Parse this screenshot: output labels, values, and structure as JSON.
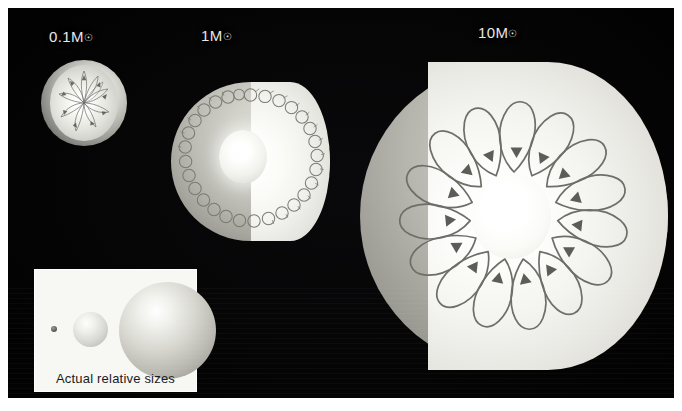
{
  "figure": {
    "background_color": "#ffffff",
    "panel_color": "#060607",
    "title_text_color": "#e9e9e6"
  },
  "stars": [
    {
      "id": "star-a",
      "mass_label": "0.1M",
      "mass_symbol": "☉",
      "structure": "fully-convective",
      "description": "Fully convective low-mass star"
    },
    {
      "id": "star-b",
      "mass_label": "1M",
      "mass_symbol": "☉",
      "structure": "radiative-core-convective-envelope",
      "description": "Radiative interior with outer convection zone"
    },
    {
      "id": "star-c",
      "mass_label": "10M",
      "mass_symbol": "☉",
      "structure": "convective-core-radiative-envelope",
      "description": "Convective core with radiative envelope"
    }
  ],
  "inset": {
    "caption": "Actual relative sizes",
    "spheres": [
      {
        "name": "sphere-small",
        "relative_size": 1
      },
      {
        "name": "sphere-medium",
        "relative_size": 6
      },
      {
        "name": "sphere-large",
        "relative_size": 16
      }
    ]
  }
}
